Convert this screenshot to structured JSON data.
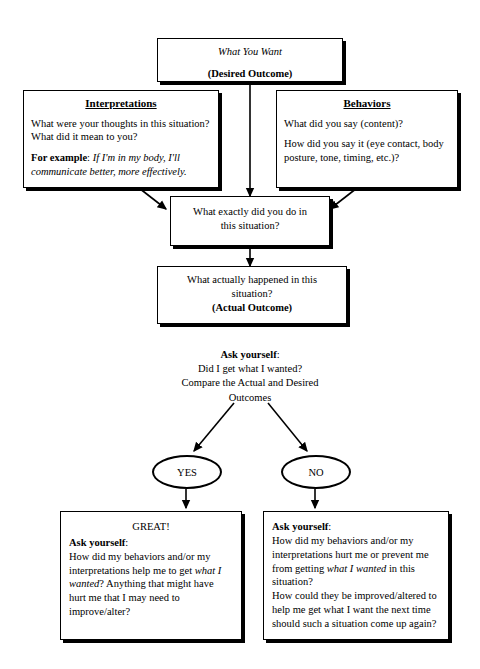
{
  "diagram": {
    "title_box": {
      "line1": "What You Want",
      "line2": "(Desired Outcome)"
    },
    "interpretations": {
      "header": "Interpretations",
      "question": "What were your thoughts in this situation? What did it mean to you?",
      "example_label": "For example",
      "example_sep": ": ",
      "example_text": "If I'm in my body, I'll communicate better, more effectively."
    },
    "behaviors": {
      "header": "Behaviors",
      "q1": "What did you say (content)?",
      "q2": "How did you say it (eye contact, body posture, tone, timing, etc.)?"
    },
    "what_exactly": {
      "line1": "What exactly did you do in",
      "line2": "this situation?"
    },
    "what_happened": {
      "line1": "What actually happened in this",
      "line2": "situation?",
      "line3": "(Actual Outcome)"
    },
    "ask_block": {
      "ask_label": "Ask yourself",
      "ask_sep": ":",
      "line1": "Did I get what I wanted?",
      "line2": "Compare the Actual and Desired",
      "line3": "Outcomes"
    },
    "decision_yes": {
      "label": "YES"
    },
    "decision_no": {
      "label": "NO"
    },
    "yes_outcome": {
      "great": "GREAT!",
      "ask_label": "Ask yourself",
      "ask_sep": ":",
      "body_a": "How did my behaviors and/or my interpretations help me to get ",
      "body_italic": "what I wanted",
      "body_b": "? Anything that might have hurt me that I may need to improve/alter?"
    },
    "no_outcome": {
      "ask_label": "Ask yourself",
      "ask_sep": ":",
      "body_a": "How did my behaviors and/or my interpretations hurt me or prevent me from getting ",
      "body_italic": "what I wanted",
      "body_b": " in this situation?",
      "body_c": "How could they be improved/altered to help me get what I want the next time should such a situation come up again?"
    },
    "colors": {
      "stroke": "#000000",
      "fill": "#ffffff",
      "text": "#000000"
    }
  }
}
